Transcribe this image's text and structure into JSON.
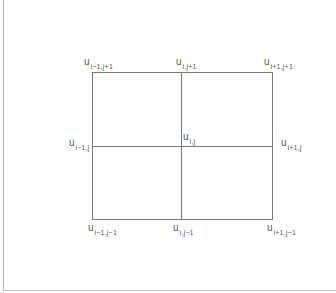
{
  "diagram": {
    "title": "",
    "type": "finite-difference-stencil-grid",
    "colors": {
      "line": "#7a7a7a",
      "label": "#5a5a5a",
      "background": "#ffffff"
    },
    "grid": {
      "rect": {
        "x1": 92,
        "y1": 72,
        "x2": 272,
        "y2": 219
      },
      "mid_x": 181,
      "mid_y": 146
    },
    "nodes": [
      {
        "id": "top-left",
        "base": "u",
        "sub": "i−1,j+1",
        "x": 84,
        "y": 57
      },
      {
        "id": "top-center",
        "base": "u",
        "sub": "i,j+1",
        "x": 176,
        "y": 57
      },
      {
        "id": "top-right",
        "base": "u",
        "sub": "i+1,j+1",
        "x": 264,
        "y": 57
      },
      {
        "id": "mid-left",
        "base": "u",
        "sub": "i−1,j",
        "x": 69,
        "y": 138
      },
      {
        "id": "center",
        "base": "u",
        "sub": "i,j",
        "x": 183,
        "y": 132
      },
      {
        "id": "mid-right",
        "base": "u",
        "sub": "i+1,j",
        "x": 281,
        "y": 138
      },
      {
        "id": "bottom-left",
        "base": "u",
        "sub": "i−1,j−1",
        "x": 88,
        "y": 223
      },
      {
        "id": "bottom-center",
        "base": "u",
        "sub": "i,j−1",
        "x": 173,
        "y": 223
      },
      {
        "id": "bottom-right",
        "base": "u",
        "sub": "i+1,j−1",
        "x": 267,
        "y": 223
      }
    ]
  }
}
